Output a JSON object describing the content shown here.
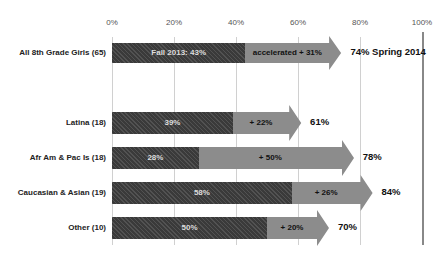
{
  "chart_data": {
    "type": "bar",
    "subtype": "stacked-horizontal-with-arrow",
    "title": "",
    "xlabel": "",
    "ylabel": "",
    "xlim": [
      0,
      100
    ],
    "x_ticks": [
      "0%",
      "20%",
      "40%",
      "60%",
      "80%",
      "100%"
    ],
    "grid": true,
    "categories": [
      "All 8th Grade Girls (65)",
      "Latina (18)",
      "Afr Am & Pac Is (18)",
      "Caucasian & Asian (19)",
      "Other (10)"
    ],
    "series": [
      {
        "name": "Fall 2013",
        "values": [
          43,
          39,
          28,
          58,
          50
        ],
        "color": "#3a3a3a"
      },
      {
        "name": "Gain",
        "values": [
          31,
          22,
          50,
          26,
          20
        ],
        "color": "#8c8c8c"
      }
    ],
    "totals_spring_2014": [
      74,
      61,
      78,
      84,
      70
    ],
    "bar_labels": [
      "Fall 2013: 43%",
      "39%",
      "28%",
      "58%",
      "50%"
    ],
    "gain_labels": [
      "accelerated + 31%",
      "+ 22%",
      "+ 50%",
      "+ 26%",
      "+ 20%"
    ],
    "end_labels": [
      "74% Spring 2014",
      "61%",
      "78%",
      "84%",
      "70%"
    ]
  }
}
